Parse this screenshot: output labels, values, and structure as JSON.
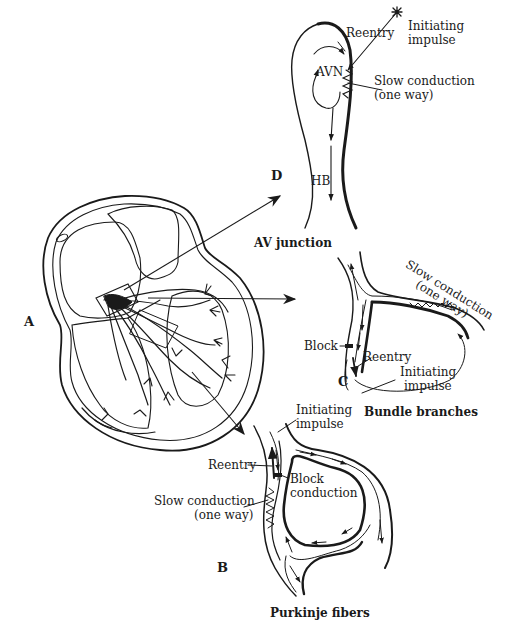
{
  "figure": {
    "panels": {
      "A": {
        "letter": "A",
        "subject": "heart-section"
      },
      "B": {
        "letter": "B",
        "caption": "Purkinje fibers",
        "labels": {
          "initiating": [
            "Initiating",
            "impulse"
          ],
          "reentry": "Reentry",
          "block": [
            "Block",
            "conduction"
          ],
          "slow": [
            "Slow conduction",
            "(one way)"
          ]
        }
      },
      "C": {
        "letter": "C",
        "caption": "Bundle branches",
        "labels": {
          "slow": [
            "Slow conduction",
            "(one way)"
          ],
          "block": "Block",
          "reentry": "Reentry",
          "initiating": [
            "Initiating",
            "impulse"
          ]
        }
      },
      "D": {
        "letter": "D",
        "caption": "AV junction",
        "labels": {
          "reentry": "Reentry",
          "initiating": [
            "Initiating",
            "impulse"
          ],
          "avn": "AVN",
          "slow": [
            "Slow conduction",
            "(one way)"
          ],
          "hb": "HB"
        }
      }
    },
    "colors": {
      "ink": "#1a1a1a",
      "background": "#ffffff"
    }
  }
}
